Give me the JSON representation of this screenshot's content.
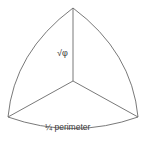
{
  "diagram": {
    "shape": "spherical-triangle",
    "vertices": {
      "top": [
        73,
        8
      ],
      "bottom_left": [
        8,
        117
      ],
      "bottom_right": [
        138,
        117
      ],
      "center": [
        73,
        81
      ]
    },
    "labels": {
      "radial": "√φ",
      "arc": "¼ perimeter"
    },
    "stroke_color": "#6a6a6a",
    "text_color": "#3a3a3a"
  }
}
